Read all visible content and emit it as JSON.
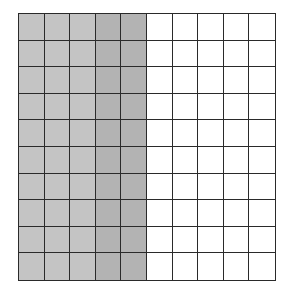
{
  "diagram": {
    "type": "hundred-grid",
    "rows": 10,
    "columns": 10,
    "shaded_columns": [
      {
        "index": 0,
        "color": "#c4c4c4"
      },
      {
        "index": 1,
        "color": "#c4c4c4"
      },
      {
        "index": 2,
        "color": "#c4c4c4"
      },
      {
        "index": 3,
        "color": "#b3b3b3"
      },
      {
        "index": 4,
        "color": "#b3b3b3"
      }
    ],
    "shaded_count": 50,
    "total_count": 100,
    "unshaded_color": "#ffffff",
    "line_color": "#2a2a2a"
  }
}
